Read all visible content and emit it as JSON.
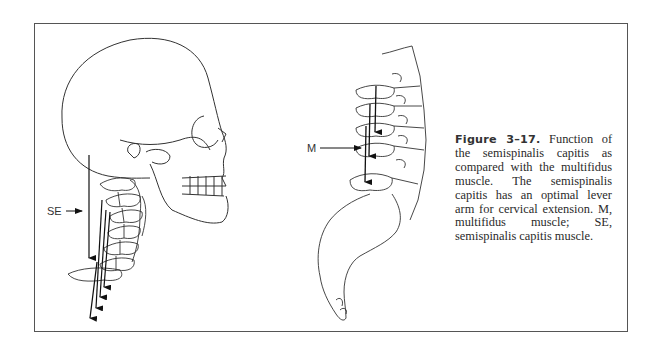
{
  "figure": {
    "label": "Figure 3–17.",
    "caption": " Function of the semispinalis capitis as compared with the multifidus muscle. The semispinalis capitis has an optimal lever arm for cervical extension. M, multifidus muscle; SE, semispinalis capitis muscle.",
    "annotations": {
      "se_label": "SE",
      "m_label": "M"
    },
    "panels": [
      {
        "name": "skull-cervical-spine",
        "description": "Lateral view of skull and cervical spine with SE force vectors"
      },
      {
        "name": "lumbar-spine-sacrum",
        "description": "Lateral view of lumbar spine and sacrum with M force vectors"
      }
    ]
  }
}
